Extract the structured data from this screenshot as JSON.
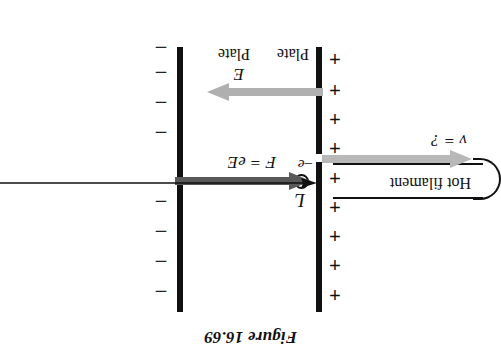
{
  "figure": {
    "title": "Figure 16.69",
    "orientation_degrees": 180
  },
  "plates": {
    "left": {
      "label": "Plate",
      "charge_symbol": "+",
      "charge_count": 9,
      "polarity": "positive",
      "color": "#111111"
    },
    "right": {
      "label": "Plate",
      "charge_symbol": "–",
      "charge_count": 8,
      "polarity": "negative",
      "color": "#111111"
    }
  },
  "filament": {
    "label": "Hot filament",
    "color": "#111111"
  },
  "electron": {
    "label": "–e",
    "shape": "circle-outline",
    "color": "#111111"
  },
  "arrows": {
    "force": {
      "label": "F = eE",
      "direction": "left",
      "color": "#595959",
      "style": "thick-block"
    },
    "field": {
      "label": "E",
      "direction": "right",
      "color": "#b0b0b0",
      "style": "thick-block"
    },
    "velocity": {
      "label": "v = ?",
      "direction": "left",
      "color": "#b8b8b8",
      "style": "thick-block"
    },
    "distance": {
      "label": "L",
      "direction": "left",
      "color": "#111111",
      "style": "thin-line"
    }
  },
  "colors": {
    "ink": "#111111",
    "dark_gray": "#595959",
    "light_gray": "#b8b8b8",
    "paper": "#ffffff"
  }
}
